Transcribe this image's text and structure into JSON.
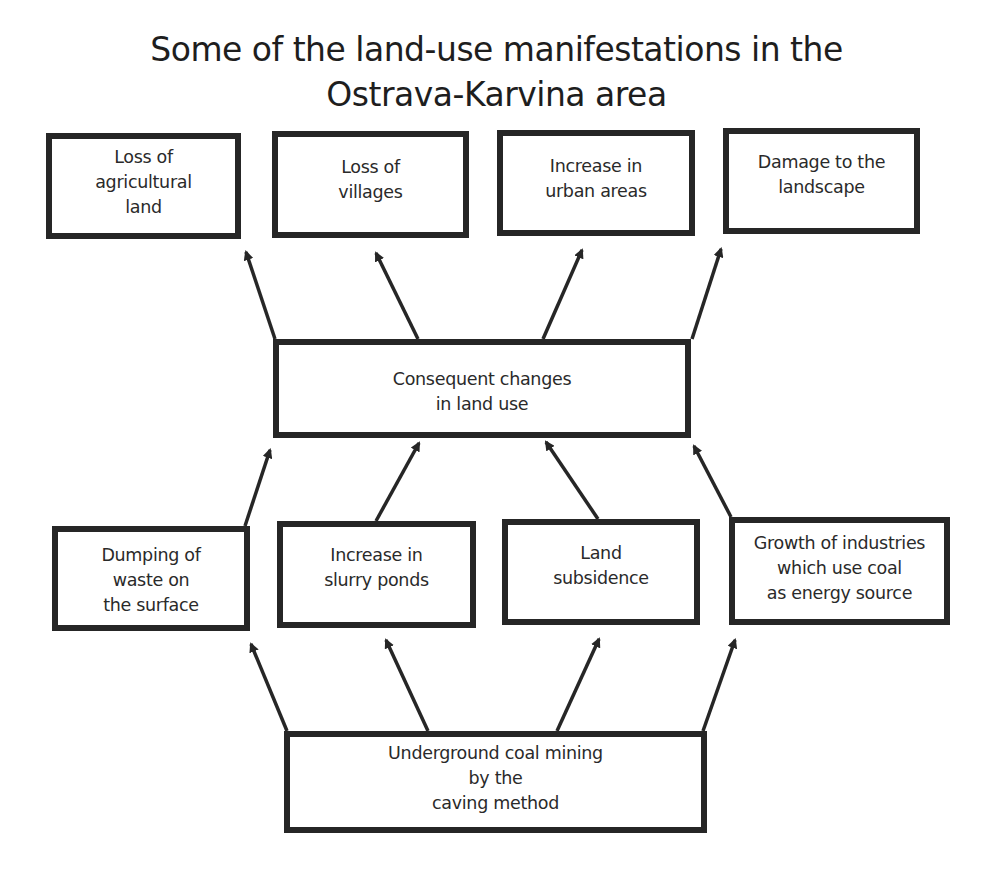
{
  "title": {
    "line1": "Some of the land-use manifestations in the",
    "line2": "Ostrava-Karvina area"
  },
  "manifestations": [
    {
      "label": "Loss of\nagricultural\nland"
    },
    {
      "label": "Loss of\nvillages"
    },
    {
      "label": "Increase in\nurban areas"
    },
    {
      "label": "Damage to the\nlandscape"
    }
  ],
  "consequence": {
    "label": "Consequent changes\nin land use"
  },
  "causes": [
    {
      "label": "Dumping of\nwaste on\nthe surface"
    },
    {
      "label": "Increase in\nslurry ponds"
    },
    {
      "label": "Land\nsubsidence"
    },
    {
      "label": "Growth of industries\nwhich use coal\nas energy source"
    }
  ],
  "root": {
    "label": "Underground coal mining\nby the\ncaving method"
  },
  "colors": {
    "stroke": "#262626",
    "background": "#ffffff",
    "text": "#2a2a2a"
  }
}
